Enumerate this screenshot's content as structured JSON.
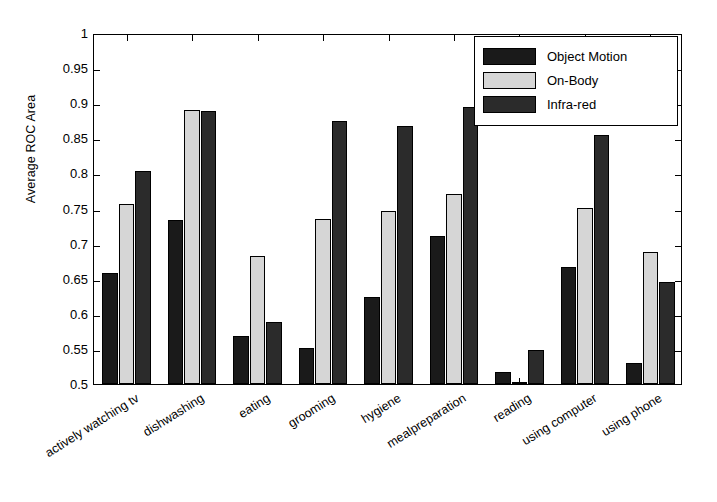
{
  "chart_data": {
    "type": "bar",
    "title": "",
    "xlabel": "",
    "ylabel": "Average ROC Area",
    "ylim": [
      0.5,
      1
    ],
    "ytick_values": [
      0.5,
      0.55,
      0.6,
      0.65,
      0.7,
      0.75,
      0.8,
      0.85,
      0.9,
      0.95,
      1
    ],
    "ytick_labels": [
      "0.5",
      "0.55",
      "0.6",
      "0.65",
      "0.7",
      "0.75",
      "0.8",
      "0.85",
      "0.9",
      "0.95",
      "1"
    ],
    "grid": false,
    "legend_position": "top-right",
    "categories": [
      "actively watching tv",
      "dishwashing",
      "eating",
      "grooming",
      "hygiene",
      "mealpreparation",
      "reading",
      "using computer",
      "using phone"
    ],
    "series": [
      {
        "name": "Object Motion",
        "color": "#1a1a1a",
        "values": [
          0.658,
          0.733,
          0.568,
          0.552,
          0.624,
          0.711,
          0.517,
          0.666,
          0.53
        ]
      },
      {
        "name": "On-Body",
        "color": "#d6d6d6",
        "values": [
          0.757,
          0.891,
          0.682,
          0.735,
          0.747,
          0.77,
          0.503,
          0.751,
          0.688
        ]
      },
      {
        "name": "Infra-red",
        "color": "#2b2b2b",
        "values": [
          0.803,
          0.889,
          0.589,
          0.875,
          0.868,
          0.894,
          0.549,
          0.855,
          0.645
        ]
      }
    ]
  },
  "legend": {
    "items": [
      {
        "label": "Object Motion",
        "color": "#1a1a1a"
      },
      {
        "label": "On-Body",
        "color": "#d6d6d6"
      },
      {
        "label": "Infra-red",
        "color": "#2b2b2b"
      }
    ]
  },
  "axis": {
    "y_label": "Average ROC Area"
  }
}
